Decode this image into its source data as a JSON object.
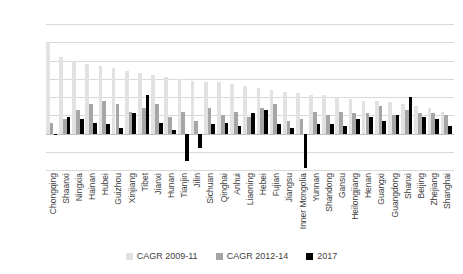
{
  "chart_data": {
    "type": "bar",
    "title": "",
    "xlabel": "",
    "ylabel": "",
    "ylim": [
      -20,
      60
    ],
    "yticks": [
      60,
      50,
      40,
      30,
      20,
      10,
      0,
      -10,
      -20
    ],
    "grid": true,
    "legend_position": "bottom",
    "categories": [
      "Chongqing",
      "Shaanxi",
      "Ningxia",
      "Hainan",
      "Hubei",
      "Guizhou",
      "Xinjiang",
      "Tibet",
      "Jianxi",
      "Hunan",
      "Tianjin",
      "Jilin",
      "Sichuan",
      "Qinghai",
      "Anhui",
      "Liaoning",
      "Hebei",
      "Fujian",
      "Jiangsu",
      "Inner Mongolia",
      "Yunnan",
      "Shandong",
      "Gansu",
      "Heilongjiang",
      "Henan",
      "Guangxi",
      "Guangdong",
      "Shanxi",
      "Beijing",
      "Zhejiang",
      "Shanghai"
    ],
    "series": [
      {
        "name": "CAGR 2009-11",
        "color": "#e2e2e2",
        "values": [
          50,
          42,
          40,
          38,
          37,
          36,
          34,
          33,
          32,
          31,
          30,
          29,
          28,
          28,
          27,
          26,
          25,
          24,
          23,
          22,
          21,
          21,
          20,
          19,
          18,
          18,
          17,
          16,
          15,
          14,
          12
        ]
      },
      {
        "name": "CAGR 2012-14",
        "color": "#a6a6a6",
        "values": [
          6,
          8,
          13,
          16,
          18,
          16,
          12,
          14,
          16,
          9,
          12,
          7,
          14,
          10,
          12,
          9,
          14,
          16,
          7,
          8,
          12,
          10,
          12,
          11,
          11,
          15,
          10,
          13,
          11,
          11,
          10
        ]
      },
      {
        "name": "2017",
        "color": "#000000",
        "values": [
          -1,
          9,
          8,
          6,
          5,
          3,
          11,
          21,
          6,
          2,
          -15,
          -8,
          5,
          6,
          4,
          11,
          13,
          5,
          3,
          -19,
          5,
          5,
          4,
          8,
          9,
          7,
          10,
          20,
          9,
          8,
          4
        ]
      }
    ]
  },
  "legend": {
    "items": [
      {
        "label": "CAGR 2009-11",
        "color": "#e2e2e2"
      },
      {
        "label": "CAGR 2012-14",
        "color": "#a6a6a6"
      },
      {
        "label": "2017",
        "color": "#000000"
      }
    ]
  }
}
